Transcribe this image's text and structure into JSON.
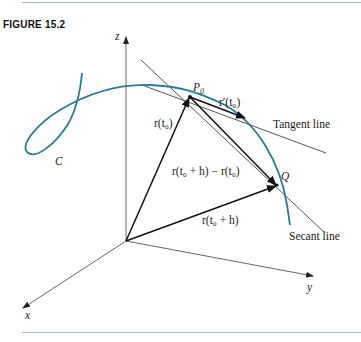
{
  "figure": {
    "label": "FIGURE 15.2"
  },
  "axes": {
    "z": "z",
    "x": "x",
    "y": "y"
  },
  "labels": {
    "curve": "C",
    "p0": "P",
    "p0_sub": "0",
    "q": "Q",
    "tangent_line": "Tangent line",
    "secant_line": "Secant line",
    "r_t0": "r(t₀)",
    "r_prime_t0": "r′(t₀)",
    "r_t0_h": "r(t₀ + h)",
    "r_diff": "r(t₀ + h) − r(t₀)"
  },
  "colors": {
    "curve": "#2e7a95",
    "vector": "#111111",
    "line": "#444444",
    "rule": "#9fb8c8"
  }
}
